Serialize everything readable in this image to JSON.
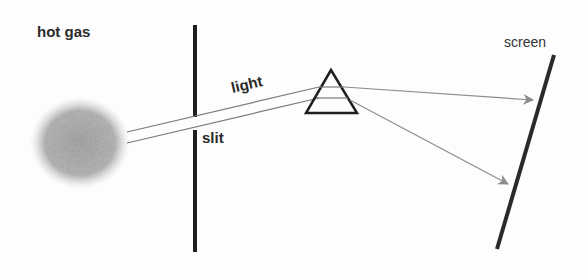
{
  "diagram": {
    "size": {
      "width": 588,
      "height": 279
    },
    "colors": {
      "background": "#fdfdfd",
      "ink": "#1f1f1f",
      "beam": "#7a7a7a",
      "arrow": "#8c8c8c",
      "gas_core": "#9a9a9a",
      "gas_edge": "#e6e6e6"
    },
    "labels": {
      "hot_gas": {
        "text": "hot gas",
        "x": 37,
        "y": 24,
        "size": 15
      },
      "light": {
        "text": "light",
        "x": 233,
        "y": 80,
        "size": 15,
        "rotate": -13
      },
      "slit": {
        "text": "slit",
        "x": 202,
        "y": 130,
        "size": 15
      },
      "screen": {
        "text": "screen",
        "x": 504,
        "y": 35,
        "size": 14
      }
    },
    "hot_gas_cloud": {
      "cx": 80,
      "cy": 143,
      "rx": 50,
      "ry": 46
    },
    "slit_barrier": {
      "x": 195,
      "upper": {
        "y1": 25,
        "y2": 117
      },
      "lower": {
        "y1": 130,
        "y2": 252
      },
      "width": 4
    },
    "beam": {
      "upper": {
        "x1": 127,
        "y1": 132,
        "x2": 319,
        "y2": 87
      },
      "lower": {
        "x1": 127,
        "y1": 143,
        "x2": 319,
        "y2": 98
      }
    },
    "prism": {
      "apex": {
        "x": 331,
        "y": 70
      },
      "base_left": {
        "x": 306,
        "y": 113
      },
      "base_right": {
        "x": 357,
        "y": 113
      },
      "inner_lines": [
        {
          "x1": 319,
          "y1": 87,
          "x2": 344,
          "y2": 87
        },
        {
          "x1": 316,
          "y1": 98,
          "x2": 348,
          "y2": 98
        }
      ]
    },
    "rays": [
      {
        "name": "upper-ray",
        "x1": 344,
        "y1": 87,
        "x2": 533,
        "y2": 100
      },
      {
        "name": "lower-ray",
        "x1": 350,
        "y1": 100,
        "x2": 508,
        "y2": 184
      }
    ],
    "screen_line": {
      "x1": 554,
      "y1": 55,
      "x2": 497,
      "y2": 249,
      "width": 4
    }
  }
}
